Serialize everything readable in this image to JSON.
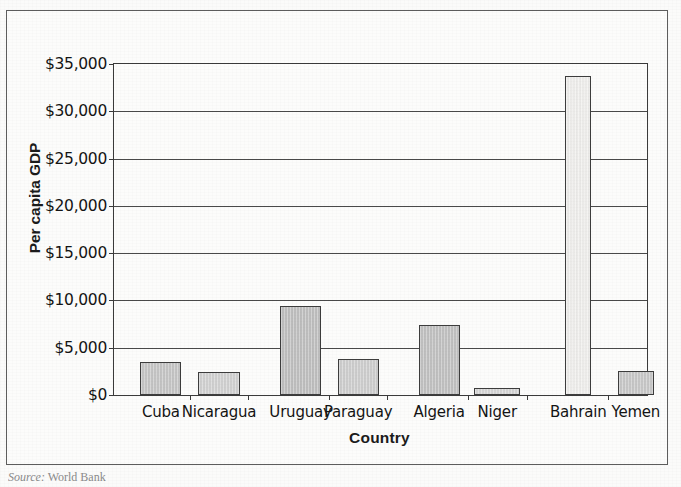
{
  "figure": {
    "source_label": "Source:",
    "source_value": "World Bank"
  },
  "chart_data": {
    "type": "bar",
    "title": "",
    "xlabel": "Country",
    "ylabel": "Per capita GDP",
    "categories": [
      "Cuba",
      "Nicaragua",
      "Uruguay",
      "Paraguay",
      "Algeria",
      "Niger",
      "Bahrain",
      "Yemen"
    ],
    "values": [
      3500,
      2400,
      9400,
      3800,
      7400,
      700,
      33700,
      2500
    ],
    "ylim": [
      0,
      35000
    ],
    "ytick_values": [
      0,
      5000,
      10000,
      15000,
      20000,
      25000,
      30000,
      35000
    ],
    "ytick_labels": [
      "$0",
      "$5,000",
      "$10,000",
      "$15,000",
      "$20,000",
      "$25,000",
      "$30,000",
      "$35,000"
    ],
    "grid": true,
    "legend": "none",
    "bar_colors": [
      "#c6c6c6",
      "#d2d2d2",
      "#c0c0c0",
      "#cfcfcf",
      "#c2c2c2",
      "#d6d6d6",
      "#f0efed",
      "#c9c9c9"
    ],
    "bar_geometry": [
      {
        "center_pct": 8.8,
        "width_pct": 7.7
      },
      {
        "center_pct": 19.7,
        "width_pct": 7.7
      },
      {
        "center_pct": 35.0,
        "width_pct": 7.7
      },
      {
        "center_pct": 45.8,
        "width_pct": 7.7
      },
      {
        "center_pct": 61.0,
        "width_pct": 7.7
      },
      {
        "center_pct": 71.9,
        "width_pct": 8.6
      },
      {
        "center_pct": 87.1,
        "width_pct": 4.8
      },
      {
        "center_pct": 97.9,
        "width_pct": 6.8
      }
    ],
    "xtick_positions_pct": [
      14.2,
      25.2,
      40.4,
      51.3,
      66.5,
      77.4,
      92.6
    ]
  }
}
